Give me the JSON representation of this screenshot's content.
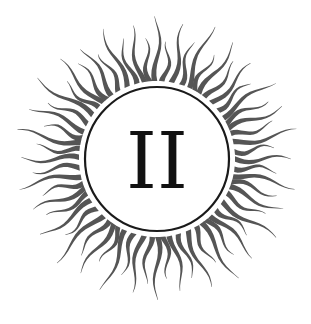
{
  "emblem": {
    "numeral": "II",
    "center": [
      157,
      159
    ],
    "circle_radius": 72,
    "ray_count": 64,
    "ray_inner_radius": 78,
    "ray_long_length": 62,
    "ray_short_length": 44,
    "ray_color": "#555555",
    "circle_color": "#1a1a1a",
    "numeral_color": "#111111",
    "background": "#ffffff"
  }
}
